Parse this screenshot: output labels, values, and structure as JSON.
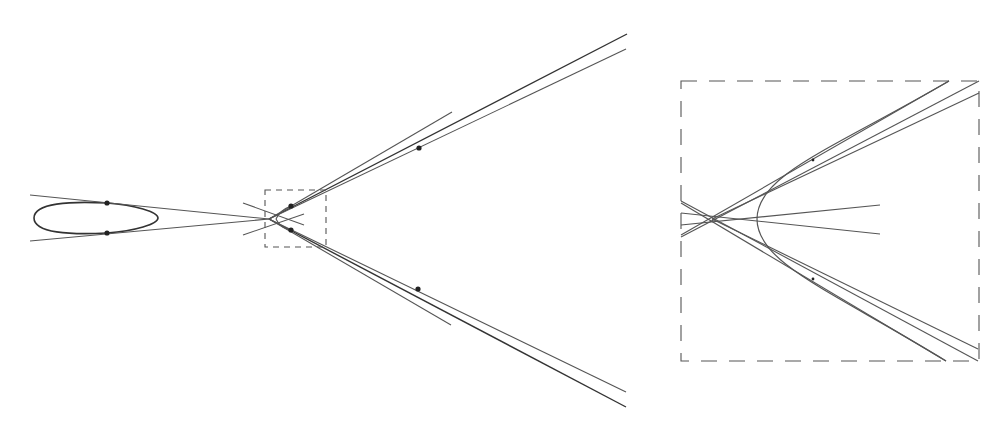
{
  "figure": {
    "colors": {
      "line": "#555555",
      "curve": "#333333",
      "point": "#222222",
      "background": "#ffffff"
    },
    "left_panel": {
      "ellipse": {
        "cx": 96,
        "cy": 218,
        "rx": 62,
        "ry": 16
      },
      "ellipse_points": [
        {
          "x": 107,
          "y": 203
        },
        {
          "x": 107,
          "y": 233
        }
      ],
      "convergence_point": {
        "x": 269,
        "y": 219
      },
      "zoom_box": {
        "x": 265,
        "y": 190,
        "width": 61,
        "height": 57
      },
      "inner_points": [
        {
          "x": 291,
          "y": 206
        },
        {
          "x": 291,
          "y": 230
        }
      ],
      "outer_points": [
        {
          "x": 419,
          "y": 148
        },
        {
          "x": 418,
          "y": 289
        }
      ]
    },
    "right_panel": {
      "zoom_box": {
        "x": 681,
        "y": 81,
        "width": 298,
        "height": 280
      },
      "convergence_point": {
        "x": 712,
        "y": 219
      },
      "hyperbola_vertex": {
        "x": 757,
        "y": 219
      }
    }
  }
}
